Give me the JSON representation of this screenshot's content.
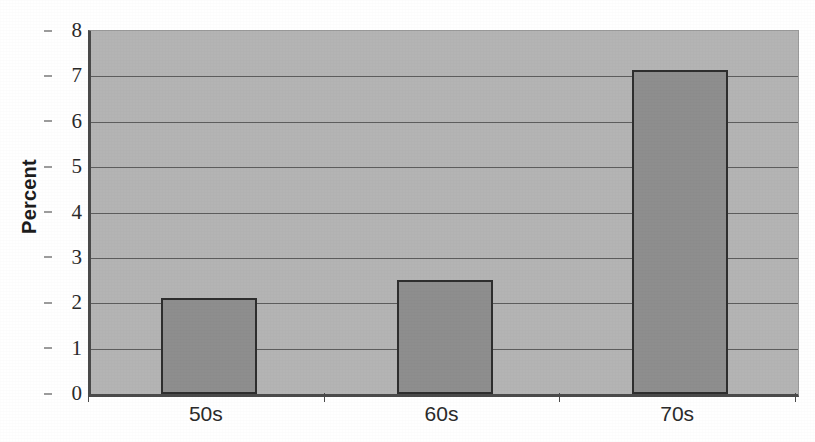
{
  "chart_data": {
    "type": "bar",
    "title": "",
    "subtitle": "",
    "xlabel": "",
    "ylabel": "Percent",
    "categories": [
      "50s",
      "60s",
      "70s"
    ],
    "values": [
      2.12,
      2.52,
      7.14
    ],
    "series": [
      {
        "name": "Percent",
        "values": [
          2.12,
          2.52,
          7.14
        ]
      }
    ],
    "ylim": [
      0,
      8
    ],
    "xlim": [
      0,
      3
    ],
    "y_ticks": [
      0,
      1,
      2,
      3,
      4,
      5,
      6,
      7,
      8
    ],
    "y_tick_labels": [
      "0",
      "1",
      "2",
      "3",
      "4",
      "5",
      "6",
      "7",
      "8"
    ],
    "grid": "horizontal",
    "legend": "none",
    "annotations": [],
    "colors": {
      "plot_background": "#b4b4b4",
      "bar_fill": "#8e8e8e",
      "bar_border": "#2e2e2e",
      "gridline": "#5d5d5d",
      "axis": "#4a4a4a",
      "text": "#1d1d1d",
      "page_background": "#ffffff"
    }
  }
}
